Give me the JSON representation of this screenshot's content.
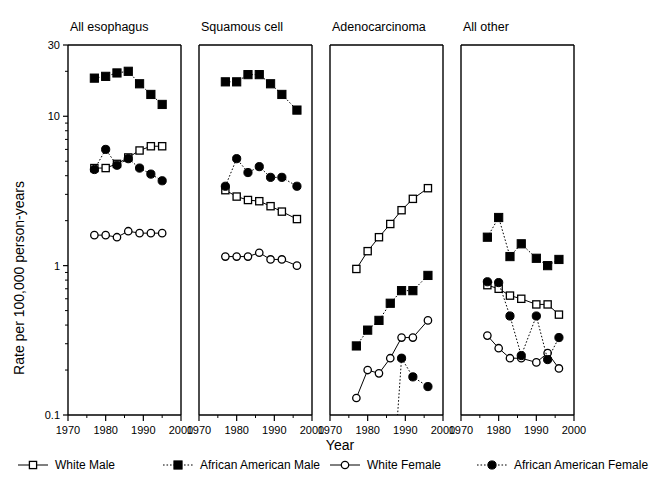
{
  "figure": {
    "xlabel": "Year",
    "ylabel": "Rate per 100,000 person-years"
  },
  "chart_data": {
    "type": "line",
    "title": "",
    "xlabel": "Year",
    "ylabel": "Rate per 100,000 person-years",
    "yscale": "log",
    "ylim": [
      0.1,
      30
    ],
    "xlim": [
      1970,
      2000
    ],
    "ytick_labels": [
      "30",
      "10",
      "1",
      "0.1"
    ],
    "ytick_values": [
      30,
      10,
      1,
      0.1
    ],
    "xtick_labels": [
      "1970",
      "1980",
      "1990",
      "2000"
    ],
    "xtick_values": [
      1970,
      1980,
      1990,
      2000
    ],
    "xminor_values": [
      1975,
      1985,
      1995
    ],
    "grid": false,
    "legend_position": "bottom",
    "legend": [
      {
        "name": "White Male",
        "marker": "open-square",
        "line": "solid"
      },
      {
        "name": "African American Male",
        "marker": "filled-square",
        "line": "dotted"
      },
      {
        "name": "White Female",
        "marker": "open-circle",
        "line": "solid"
      },
      {
        "name": "African American Female",
        "marker": "filled-circle",
        "line": "dotted"
      }
    ],
    "panels": [
      {
        "title": "All esophagus",
        "x": [
          1977,
          1980,
          1983,
          1986,
          1989,
          1992,
          1995
        ],
        "series": [
          {
            "name": "White Male",
            "marker": "open-square",
            "line": "solid",
            "values": [
              4.5,
              4.5,
              4.8,
              5.3,
              5.9,
              6.3,
              6.3
            ]
          },
          {
            "name": "African American Male",
            "marker": "filled-square",
            "line": "dotted",
            "values": [
              18.0,
              18.5,
              19.5,
              20.0,
              16.5,
              14.0,
              12.0
            ]
          },
          {
            "name": "White Female",
            "marker": "open-circle",
            "line": "solid",
            "values": [
              1.6,
              1.6,
              1.55,
              1.7,
              1.65,
              1.65,
              1.65
            ]
          },
          {
            "name": "African American Female",
            "marker": "filled-circle",
            "line": "dotted",
            "values": [
              4.4,
              6.0,
              4.7,
              5.2,
              4.5,
              4.1,
              3.7
            ]
          }
        ]
      },
      {
        "title": "Squamous cell",
        "x": [
          1977,
          1980,
          1983,
          1986,
          1989,
          1992,
          1996
        ],
        "series": [
          {
            "name": "White Male",
            "marker": "open-square",
            "line": "solid",
            "values": [
              3.2,
              2.9,
              2.75,
              2.7,
              2.5,
              2.3,
              2.05
            ]
          },
          {
            "name": "African American Male",
            "marker": "filled-square",
            "line": "dotted",
            "values": [
              17.0,
              17.0,
              19.0,
              19.0,
              16.5,
              14.0,
              11.0
            ]
          },
          {
            "name": "White Female",
            "marker": "open-circle",
            "line": "solid",
            "values": [
              1.15,
              1.15,
              1.15,
              1.22,
              1.1,
              1.1,
              1.0
            ]
          },
          {
            "name": "African American Female",
            "marker": "filled-circle",
            "line": "dotted",
            "values": [
              3.4,
              5.2,
              4.2,
              4.6,
              3.9,
              3.9,
              3.4
            ]
          }
        ]
      },
      {
        "title": "Adenocarcinoma",
        "x": [
          1977,
          1980,
          1983,
          1986,
          1989,
          1992,
          1996
        ],
        "series": [
          {
            "name": "White Male",
            "marker": "open-square",
            "line": "solid",
            "values": [
              0.95,
              1.25,
              1.55,
              1.9,
              2.35,
              2.8,
              3.3
            ]
          },
          {
            "name": "African American Male",
            "marker": "filled-square",
            "line": "dotted",
            "values": [
              0.29,
              0.37,
              0.43,
              0.56,
              0.68,
              0.68,
              0.86
            ]
          },
          {
            "name": "White Female",
            "marker": "open-circle",
            "line": "solid",
            "values": [
              0.13,
              0.2,
              0.19,
              0.24,
              0.33,
              0.33,
              0.43
            ]
          },
          {
            "name": "African American Female",
            "marker": "filled-circle",
            "line": "dotted",
            "values": [
              null,
              null,
              null,
              null,
              0.24,
              0.18,
              0.155
            ]
          }
        ]
      },
      {
        "title": "All other",
        "x": [
          1977,
          1980,
          1983,
          1986,
          1990,
          1993,
          1996
        ],
        "series": [
          {
            "name": "White Male",
            "marker": "open-square",
            "line": "solid",
            "values": [
              0.74,
              0.7,
              0.63,
              0.6,
              0.55,
              0.55,
              0.47
            ]
          },
          {
            "name": "African American Male",
            "marker": "filled-square",
            "line": "dotted",
            "values": [
              1.55,
              2.1,
              1.15,
              1.4,
              1.12,
              1.0,
              1.1
            ]
          },
          {
            "name": "White Female",
            "marker": "open-circle",
            "line": "solid",
            "values": [
              0.34,
              0.28,
              0.24,
              0.24,
              0.225,
              0.26,
              0.205
            ]
          },
          {
            "name": "African American Female",
            "marker": "filled-circle",
            "line": "dotted",
            "values": [
              0.78,
              0.77,
              0.46,
              0.25,
              0.46,
              0.235,
              0.33
            ]
          }
        ]
      }
    ]
  }
}
